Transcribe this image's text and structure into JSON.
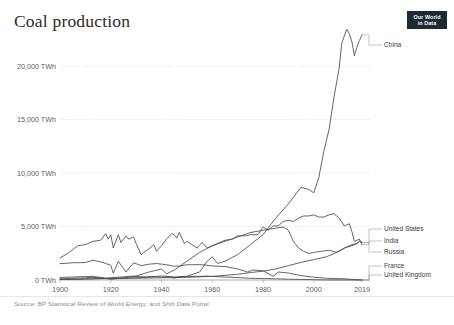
{
  "header": {
    "title": "Coal production",
    "logo_line1": "Our World",
    "logo_line2": "in Data"
  },
  "footer": {
    "source": "Source: BP Statistical Review of World Energy; and Shift Data Portal"
  },
  "chart_data": {
    "type": "line",
    "title": "Coal production",
    "xlabel": "",
    "ylabel": "",
    "unit": "TWh",
    "grid": true,
    "legend_position": "right-inline-labels",
    "xlim": [
      1900,
      2019
    ],
    "ylim": [
      0,
      24000
    ],
    "ytick_labels": [
      "0 TWh",
      "5,000 TWh",
      "10,000 TWh",
      "15,000 TWh",
      "20,000 TWh"
    ],
    "ytick_values": [
      0,
      5000,
      10000,
      15000,
      20000
    ],
    "xtick_labels": [
      "1900",
      "1920",
      "1940",
      "1960",
      "1980",
      "2000",
      "2019"
    ],
    "xtick_values": [
      1900,
      1920,
      1940,
      1960,
      1980,
      2000,
      2019
    ],
    "series": [
      {
        "name": "China",
        "label": "China",
        "x": [
          1900,
          1905,
          1910,
          1915,
          1920,
          1925,
          1930,
          1935,
          1940,
          1945,
          1950,
          1955,
          1958,
          1960,
          1962,
          1965,
          1970,
          1975,
          1980,
          1985,
          1990,
          1995,
          1998,
          2000,
          2002,
          2004,
          2006,
          2008,
          2010,
          2011,
          2012,
          2013,
          2014,
          2015,
          2016,
          2017,
          2018,
          2019
        ],
        "values": [
          40,
          60,
          90,
          130,
          160,
          180,
          200,
          260,
          360,
          280,
          340,
          720,
          1700,
          2100,
          1500,
          1700,
          2300,
          3200,
          4100,
          5600,
          6900,
          8400,
          8200,
          7900,
          9300,
          11700,
          13600,
          16600,
          19200,
          21400,
          22100,
          22700,
          22300,
          21600,
          20300,
          21100,
          21700,
          22200
        ]
      },
      {
        "name": "United States",
        "label": "United States",
        "x": [
          1900,
          1903,
          1907,
          1910,
          1913,
          1916,
          1918,
          1919,
          1920,
          1921,
          1923,
          1924,
          1926,
          1927,
          1929,
          1930,
          1932,
          1933,
          1935,
          1937,
          1938,
          1940,
          1942,
          1944,
          1945,
          1946,
          1947,
          1949,
          1950,
          1952,
          1954,
          1956,
          1958,
          1960,
          1962,
          1965,
          1968,
          1970,
          1973,
          1975,
          1978,
          1980,
          1982,
          1984,
          1986,
          1988,
          1990,
          1992,
          1994,
          1996,
          1998,
          2000,
          2002,
          2004,
          2006,
          2008,
          2010,
          2012,
          2014,
          2015,
          2016,
          2017,
          2018,
          2019
        ],
        "values": [
          2000,
          2400,
          3100,
          3200,
          3500,
          3600,
          4200,
          3700,
          4100,
          2900,
          4100,
          3400,
          4000,
          3700,
          3900,
          3300,
          2300,
          2500,
          2800,
          3200,
          2600,
          3100,
          3700,
          4200,
          4100,
          3800,
          4300,
          3300,
          3500,
          3200,
          2900,
          3400,
          2900,
          3100,
          3300,
          3600,
          3700,
          4000,
          4000,
          4100,
          4100,
          4800,
          4500,
          4900,
          4900,
          5300,
          5400,
          5300,
          5600,
          5800,
          5800,
          5900,
          5700,
          5700,
          5900,
          6000,
          5600,
          4900,
          5100,
          4400,
          3500,
          3600,
          3700,
          3200
        ]
      },
      {
        "name": "India",
        "label": "India",
        "x": [
          1900,
          1910,
          1920,
          1930,
          1940,
          1950,
          1960,
          1965,
          1970,
          1975,
          1980,
          1985,
          1990,
          1995,
          2000,
          2005,
          2010,
          2013,
          2015,
          2017,
          2018,
          2019
        ],
        "values": [
          40,
          90,
          130,
          160,
          200,
          240,
          330,
          420,
          520,
          670,
          800,
          1000,
          1300,
          1600,
          1850,
          2100,
          2600,
          3000,
          3200,
          3300,
          3500,
          3400
        ]
      },
      {
        "name": "Russia",
        "label": "Russia",
        "x": [
          1900,
          1910,
          1913,
          1917,
          1920,
          1925,
          1930,
          1935,
          1940,
          1942,
          1945,
          1950,
          1955,
          1960,
          1965,
          1970,
          1975,
          1980,
          1985,
          1988,
          1990,
          1992,
          1994,
          1996,
          1998,
          2000,
          2003,
          2006,
          2009,
          2012,
          2015,
          2017,
          2018,
          2019
        ],
        "values": [
          110,
          200,
          240,
          180,
          60,
          180,
          360,
          720,
          990,
          560,
          900,
          1700,
          2500,
          3100,
          3500,
          3900,
          4300,
          4500,
          4700,
          4800,
          4500,
          3500,
          2900,
          2600,
          2400,
          2500,
          2600,
          2700,
          2500,
          2900,
          3100,
          3300,
          3500,
          3400
        ]
      },
      {
        "name": "France",
        "label": "France",
        "x": [
          1900,
          1910,
          1913,
          1918,
          1920,
          1925,
          1929,
          1932,
          1935,
          1938,
          1940,
          1943,
          1945,
          1948,
          1950,
          1955,
          1958,
          1960,
          1965,
          1970,
          1975,
          1980,
          1985,
          1990,
          1995,
          2000,
          2004,
          2010,
          2015,
          2019
        ],
        "values": [
          230,
          310,
          330,
          160,
          200,
          290,
          350,
          290,
          290,
          300,
          250,
          290,
          170,
          300,
          320,
          330,
          350,
          320,
          270,
          220,
          150,
          130,
          110,
          70,
          50,
          30,
          10,
          5,
          2,
          1
        ]
      },
      {
        "name": "United Kingdom",
        "label": "United Kingdom",
        "x": [
          1900,
          1905,
          1910,
          1913,
          1916,
          1918,
          1920,
          1921,
          1923,
          1926,
          1929,
          1932,
          1935,
          1938,
          1940,
          1943,
          1945,
          1947,
          1950,
          1955,
          1957,
          1960,
          1965,
          1970,
          1974,
          1976,
          1980,
          1984,
          1986,
          1990,
          1993,
          1995,
          2000,
          2005,
          2010,
          2013,
          2015,
          2017,
          2019
        ],
        "values": [
          1480,
          1560,
          1580,
          1790,
          1640,
          1500,
          1330,
          620,
          1700,
          720,
          1560,
          1300,
          1430,
          1490,
          1440,
          1340,
          1250,
          1270,
          1380,
          1390,
          1360,
          1270,
          1220,
          1000,
          720,
          900,
          840,
          340,
          720,
          640,
          480,
          400,
          250,
          160,
          120,
          100,
          60,
          20,
          10
        ]
      }
    ]
  },
  "axis": {
    "y_labels": [
      {
        "text": "20,000 TWh",
        "value": 20000
      },
      {
        "text": "15,000 TWh",
        "value": 15000
      },
      {
        "text": "10,000 TWh",
        "value": 10000
      },
      {
        "text": "5,000 TWh",
        "value": 5000
      },
      {
        "text": "0 TWh",
        "value": 0
      }
    ],
    "x_labels": [
      "1900",
      "1920",
      "1940",
      "1960",
      "1980",
      "2000",
      "2019"
    ]
  }
}
